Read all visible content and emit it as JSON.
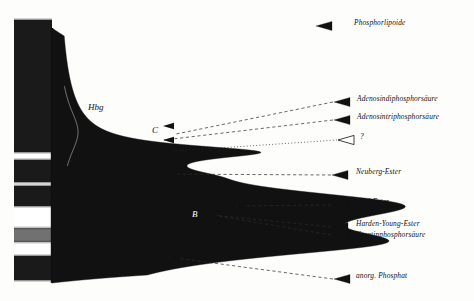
{
  "figure": {
    "kind": "electropherogram-densitometry",
    "background_color": "#fdfdfc",
    "ink_color": "#111111"
  },
  "gel_strip": {
    "name": "electrophoresis-strip",
    "x": 14,
    "y": 20,
    "width": 38,
    "height": 260,
    "band_color": "#1a1a1a",
    "gap_color": "#ffffff",
    "bands": [
      {
        "label": "origin-block",
        "top": 20,
        "height": 132,
        "opacity": 1.0
      },
      {
        "label": "band-1",
        "top": 160,
        "height": 22,
        "opacity": 1.0
      },
      {
        "label": "band-2",
        "top": 186,
        "height": 20,
        "opacity": 1.0
      },
      {
        "label": "band-3-faint",
        "top": 228,
        "height": 14,
        "opacity": 0.62
      },
      {
        "label": "band-4",
        "top": 256,
        "height": 24,
        "opacity": 1.0
      }
    ]
  },
  "trace": {
    "name": "densitometer-trace",
    "baseline_x": 52,
    "baseline_top": 28,
    "baseline_bottom": 283,
    "fill_color": "#111111",
    "orientation": "horizontal-peaks-rightward"
  },
  "curve_labels": [
    {
      "id": "hbg",
      "text": "Hbg",
      "x": 88,
      "y": 103,
      "on_dark": false
    },
    {
      "id": "c",
      "text": "C",
      "x": 152,
      "y": 126,
      "on_dark": false
    },
    {
      "id": "b1",
      "text": "B",
      "sub": "1",
      "x": 143,
      "y": 169,
      "on_dark": false
    },
    {
      "id": "b",
      "text": "B",
      "x": 192,
      "y": 210,
      "on_dark": true
    },
    {
      "id": "a",
      "text": "A",
      "x": 146,
      "y": 255,
      "on_dark": false
    }
  ],
  "annotations": [
    {
      "id": "phospholipide",
      "text": "Phosphorlipoide",
      "label_x": 354,
      "label_y": 24,
      "marker": {
        "x": 316,
        "y": 26,
        "style": "filled"
      },
      "leader": null
    },
    {
      "id": "adp",
      "text": "Adenosindiphosphorsäure",
      "label_x": 357,
      "label_y": 100,
      "marker": {
        "x": 334,
        "y": 102,
        "style": "filled"
      },
      "leader": {
        "to_x": 176,
        "to_y": 134,
        "style": "dashed"
      }
    },
    {
      "id": "atp",
      "text": "Adenosintriphosphorsäure",
      "label_x": 357,
      "label_y": 118,
      "marker": {
        "x": 334,
        "y": 120,
        "style": "filled"
      },
      "leader": {
        "to_x": 164,
        "to_y": 140,
        "style": "dashed"
      }
    },
    {
      "id": "unknown",
      "text": "?",
      "label_x": 360,
      "label_y": 138,
      "marker": {
        "x": 338,
        "y": 140,
        "style": "hollow"
      },
      "leader": {
        "to_x": 160,
        "to_y": 152,
        "style": "dotted"
      }
    },
    {
      "id": "neuberg",
      "text": "Neuberg-Ester",
      "label_x": 356,
      "label_y": 173,
      "marker": {
        "x": 332,
        "y": 175,
        "style": "filled"
      },
      "leader": {
        "to_x": 163,
        "to_y": 174,
        "style": "dashed"
      }
    },
    {
      "id": "cori",
      "text": "Cori-Ester",
      "label_x": 356,
      "label_y": 203,
      "marker": {
        "x": 332,
        "y": 205,
        "style": "filled"
      },
      "leader": {
        "to_x": 236,
        "to_y": 206,
        "style": "dashed"
      }
    },
    {
      "id": "harden-young",
      "text": "Harden-Young-Ester",
      "label_x": 356,
      "label_y": 225,
      "marker": {
        "x": 332,
        "y": 227,
        "style": "filled"
      },
      "leader": {
        "to_x": 212,
        "to_y": 215,
        "style": "dashed"
      }
    },
    {
      "id": "kreatinphosphat",
      "text": "Kreatinphosphorsäure",
      "label_x": 356,
      "label_y": 236,
      "marker": {
        "x": 332,
        "y": 235,
        "style": "filled"
      },
      "leader": {
        "to_x": 212,
        "to_y": 215,
        "style": "dashed"
      }
    },
    {
      "id": "anorg-phosphat",
      "text": "anorg. Phosphat",
      "label_x": 356,
      "label_y": 277,
      "marker": {
        "x": 334,
        "y": 279,
        "style": "filled"
      },
      "leader": {
        "to_x": 168,
        "to_y": 257,
        "style": "dashed"
      }
    }
  ],
  "chart_data": {
    "type": "line",
    "title": "",
    "xlabel": "",
    "ylabel": "",
    "orientation": "peaks extend to the right from a vertical baseline (migration axis is vertical, downward)",
    "axis_range_migration_px": [
      28,
      283
    ],
    "peaks": [
      {
        "name": "Hbg",
        "center": 132,
        "amplitude": 20,
        "width": 30,
        "note": "shoulder, outline only"
      },
      {
        "name": "C",
        "center": 152,
        "amplitude": 152,
        "width": 9
      },
      {
        "name": "B1",
        "center": 176,
        "amplitude": 30,
        "width": 9
      },
      {
        "name": "B",
        "center": 205,
        "amplitude": 290,
        "width": 22
      },
      {
        "name": "A",
        "center": 243,
        "amplitude": 262,
        "width": 20
      }
    ],
    "legend_entries": [
      "Phosphorlipoide",
      "Adenosindiphosphorsäure",
      "Adenosintriphosphorsäure",
      "?",
      "Neuberg-Ester",
      "Cori-Ester",
      "Harden-Young-Ester",
      "Kreatinphosphorsäure",
      "anorg. Phosphat"
    ],
    "grid": false,
    "legend_position": "right"
  }
}
